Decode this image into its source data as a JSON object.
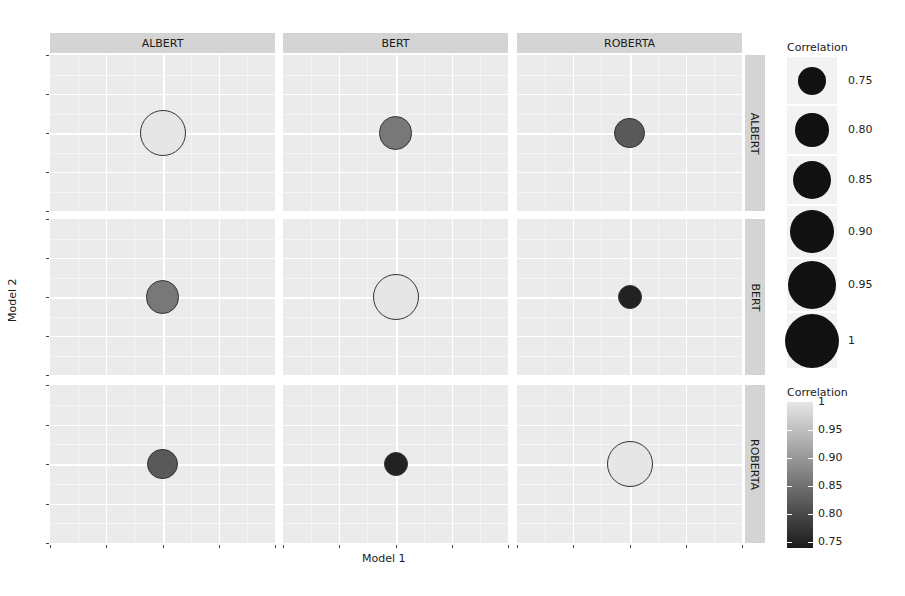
{
  "chart_data": {
    "type": "scatter",
    "subtype": "faceted correlation bubble matrix",
    "title": "",
    "xlabel": "Model 1",
    "ylabel": "Model 2",
    "facet_columns": [
      "ALBERT",
      "BERT",
      "ROBERTA"
    ],
    "facet_rows": [
      "ALBERT",
      "BERT",
      "ROBERTA"
    ],
    "cells": [
      {
        "col": "ALBERT",
        "row": "ALBERT",
        "correlation": 1.0
      },
      {
        "col": "BERT",
        "row": "ALBERT",
        "correlation": 0.86
      },
      {
        "col": "ROBERTA",
        "row": "ALBERT",
        "correlation": 0.82
      },
      {
        "col": "ALBERT",
        "row": "BERT",
        "correlation": 0.86
      },
      {
        "col": "BERT",
        "row": "BERT",
        "correlation": 1.0
      },
      {
        "col": "ROBERTA",
        "row": "BERT",
        "correlation": 0.75
      },
      {
        "col": "ALBERT",
        "row": "ROBERTA",
        "correlation": 0.82
      },
      {
        "col": "BERT",
        "row": "ROBERTA",
        "correlation": 0.75
      },
      {
        "col": "ROBERTA",
        "row": "ROBERTA",
        "correlation": 1.0
      }
    ],
    "size_legend": {
      "title": "Correlation",
      "labels": [
        "0.75",
        "0.80",
        "0.85",
        "0.90",
        "0.95",
        "1"
      ],
      "values": [
        0.75,
        0.8,
        0.85,
        0.9,
        0.95,
        1.0
      ]
    },
    "color_legend": {
      "title": "Correlation",
      "labels": [
        "1",
        "0.95",
        "0.90",
        "0.85",
        "0.80",
        "0.75"
      ],
      "range": [
        0.74,
        1.0
      ],
      "low_color": "#1a1a1a",
      "high_color": "#e6e6e6"
    },
    "grid": true,
    "legend_position": "right"
  },
  "colors": {
    "panel_bg": "#ebebeb",
    "strip_bg": "#d4d4d4",
    "grid": "#ffffff"
  }
}
